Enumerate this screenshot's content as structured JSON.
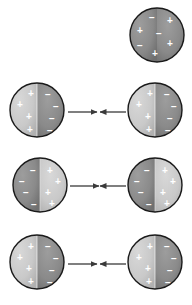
{
  "figure": {
    "width": 192,
    "height": 305,
    "background": "#ffffff",
    "colors": {
      "sphere_dark": "#8a8a8a",
      "sphere_light": "#c9c9c9",
      "sphere_outline": "#1a1a1a",
      "sign_color": "#ffffff",
      "arrow_color": "#3a3a3a"
    },
    "symbols": {
      "plus": "+",
      "minus": "−"
    },
    "rows": [
      {
        "row_name": "row-neutral-single",
        "spheres": [
          {
            "position": "right",
            "cx": 157,
            "cy": 35,
            "r": 27,
            "fill_left": "#8a8a8a",
            "fill_right": "#8a8a8a",
            "polarized": false,
            "charges": [
              {
                "sign": "−",
                "x": 152,
                "y": 17
              },
              {
                "sign": "+",
                "x": 170,
                "y": 20
              },
              {
                "sign": "+",
                "x": 140,
                "y": 30
              },
              {
                "sign": "−",
                "x": 159,
                "y": 33
              },
              {
                "sign": "−",
                "x": 140,
                "y": 45
              },
              {
                "sign": "+",
                "x": 170,
                "y": 43
              },
              {
                "sign": "+",
                "x": 155,
                "y": 53
              }
            ]
          }
        ],
        "arrows": []
      },
      {
        "row_name": "row-attract-1",
        "spheres": [
          {
            "position": "left",
            "cx": 37,
            "cy": 110,
            "r": 27,
            "fill_left": "#c9c9c9",
            "fill_right": "#8a8a8a",
            "polarized": true,
            "charges": [
              {
                "sign": "+",
                "x": 31,
                "y": 93
              },
              {
                "sign": "−",
                "x": 48,
                "y": 94
              },
              {
                "sign": "+",
                "x": 20,
                "y": 104
              },
              {
                "sign": "−",
                "x": 56,
                "y": 106
              },
              {
                "sign": "+",
                "x": 29,
                "y": 116
              },
              {
                "sign": "−",
                "x": 52,
                "y": 118
              },
              {
                "sign": "+",
                "x": 30,
                "y": 129
              },
              {
                "sign": "−",
                "x": 50,
                "y": 130
              }
            ]
          },
          {
            "position": "right",
            "cx": 155,
            "cy": 110,
            "r": 27,
            "fill_left": "#c9c9c9",
            "fill_right": "#8a8a8a",
            "polarized": true,
            "charges": [
              {
                "sign": "+",
                "x": 150,
                "y": 93
              },
              {
                "sign": "−",
                "x": 167,
                "y": 94
              },
              {
                "sign": "+",
                "x": 139,
                "y": 104
              },
              {
                "sign": "−",
                "x": 174,
                "y": 106
              },
              {
                "sign": "+",
                "x": 148,
                "y": 116
              },
              {
                "sign": "−",
                "x": 170,
                "y": 118
              },
              {
                "sign": "+",
                "x": 149,
                "y": 129
              },
              {
                "sign": "−",
                "x": 168,
                "y": 130
              }
            ]
          }
        ],
        "arrows": [
          {
            "name": "arrow-right-1",
            "x1": 68,
            "y1": 112,
            "x2": 97,
            "y2": 112,
            "direction": "right"
          },
          {
            "name": "arrow-left-1",
            "x1": 126,
            "y1": 112,
            "x2": 100,
            "y2": 112,
            "direction": "left"
          }
        ]
      },
      {
        "row_name": "row-attract-2",
        "spheres": [
          {
            "position": "left",
            "cx": 40,
            "cy": 185,
            "r": 27,
            "fill_left": "#8a8a8a",
            "fill_right": "#c9c9c9",
            "polarized": true,
            "charges": [
              {
                "sign": "−",
                "x": 33,
                "y": 170
              },
              {
                "sign": "+",
                "x": 50,
                "y": 170
              },
              {
                "sign": "−",
                "x": 22,
                "y": 181
              },
              {
                "sign": "+",
                "x": 58,
                "y": 181
              },
              {
                "sign": "−",
                "x": 26,
                "y": 192
              },
              {
                "sign": "+",
                "x": 48,
                "y": 192
              },
              {
                "sign": "−",
                "x": 34,
                "y": 204
              },
              {
                "sign": "+",
                "x": 52,
                "y": 203
              }
            ]
          },
          {
            "position": "right",
            "cx": 155,
            "cy": 185,
            "r": 27,
            "fill_left": "#8a8a8a",
            "fill_right": "#c9c9c9",
            "polarized": true,
            "charges": [
              {
                "sign": "−",
                "x": 147,
                "y": 170
              },
              {
                "sign": "+",
                "x": 165,
                "y": 170
              },
              {
                "sign": "−",
                "x": 137,
                "y": 181
              },
              {
                "sign": "+",
                "x": 173,
                "y": 181
              },
              {
                "sign": "−",
                "x": 141,
                "y": 192
              },
              {
                "sign": "+",
                "x": 163,
                "y": 192
              },
              {
                "sign": "−",
                "x": 149,
                "y": 204
              },
              {
                "sign": "+",
                "x": 167,
                "y": 203
              }
            ]
          }
        ],
        "arrows": [
          {
            "name": "arrow-right-2",
            "x1": 70,
            "y1": 186,
            "x2": 99,
            "y2": 186,
            "direction": "right"
          },
          {
            "name": "arrow-left-2",
            "x1": 126,
            "y1": 186,
            "x2": 100,
            "y2": 186,
            "direction": "left"
          }
        ]
      },
      {
        "row_name": "row-attract-3",
        "spheres": [
          {
            "position": "left",
            "cx": 37,
            "cy": 262,
            "r": 27,
            "fill_left": "#c9c9c9",
            "fill_right": "#8a8a8a",
            "polarized": true,
            "charges": [
              {
                "sign": "+",
                "x": 31,
                "y": 246
              },
              {
                "sign": "−",
                "x": 48,
                "y": 246
              },
              {
                "sign": "+",
                "x": 20,
                "y": 257
              },
              {
                "sign": "−",
                "x": 56,
                "y": 258
              },
              {
                "sign": "+",
                "x": 29,
                "y": 268
              },
              {
                "sign": "−",
                "x": 52,
                "y": 270
              },
              {
                "sign": "+",
                "x": 31,
                "y": 281
              },
              {
                "sign": "−",
                "x": 50,
                "y": 282
              }
            ]
          },
          {
            "position": "right",
            "cx": 155,
            "cy": 262,
            "r": 27,
            "fill_left": "#c9c9c9",
            "fill_right": "#8a8a8a",
            "polarized": true,
            "charges": [
              {
                "sign": "+",
                "x": 150,
                "y": 246
              },
              {
                "sign": "−",
                "x": 167,
                "y": 246
              },
              {
                "sign": "+",
                "x": 139,
                "y": 257
              },
              {
                "sign": "−",
                "x": 174,
                "y": 258
              },
              {
                "sign": "+",
                "x": 148,
                "y": 268
              },
              {
                "sign": "−",
                "x": 170,
                "y": 270
              },
              {
                "sign": "+",
                "x": 149,
                "y": 281
              },
              {
                "sign": "−",
                "x": 168,
                "y": 282
              }
            ]
          }
        ],
        "arrows": [
          {
            "name": "arrow-right-3",
            "x1": 68,
            "y1": 264,
            "x2": 97,
            "y2": 264,
            "direction": "right"
          },
          {
            "name": "arrow-left-3",
            "x1": 126,
            "y1": 264,
            "x2": 100,
            "y2": 264,
            "direction": "left"
          }
        ]
      }
    ]
  }
}
